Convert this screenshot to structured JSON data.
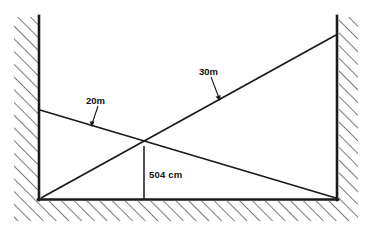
{
  "figure": {
    "type": "geometry-diagram",
    "background_color": "#ffffff",
    "line_color": "#1a1a1a",
    "hatch_color": "#3a3a3a"
  },
  "labels": {
    "ladder_left": "20m",
    "ladder_right": "30m",
    "crossing_height": "504 cm"
  },
  "geometry": {
    "left_wall_x": 39,
    "right_wall_x": 337,
    "floor_y": 199,
    "ceiling_y": 17,
    "left_wall_top_y": 17,
    "right_wall_top_y": 17,
    "ladder_left_top": [
      40,
      110
    ],
    "ladder_left_bottom": [
      336,
      198
    ],
    "ladder_right_top": [
      336,
      35
    ],
    "ladder_right_bottom": [
      41,
      198
    ],
    "crossing_point": [
      144,
      146
    ],
    "drop_line_bottom": [
      144,
      199
    ]
  },
  "leaders": {
    "label_20m_anchor": [
      98,
      103
    ],
    "label_20m_tip": [
      92,
      126
    ],
    "label_30m_anchor": [
      211,
      74
    ],
    "label_30m_tip": [
      219,
      100
    ]
  },
  "hatching": {
    "left_wall_band_x": [
      14,
      38
    ],
    "right_wall_band_x": [
      339,
      358
    ],
    "floor_band_y": [
      201,
      221
    ],
    "angle_deg": 45,
    "spacing_px": 9
  }
}
